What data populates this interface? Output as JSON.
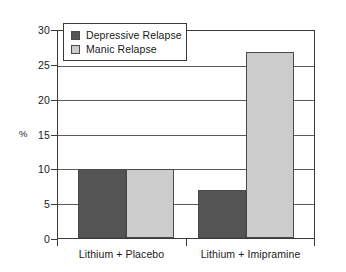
{
  "chart_data": {
    "type": "bar",
    "title": "",
    "xlabel": "",
    "ylabel": "%",
    "ylim": [
      0,
      30
    ],
    "ytick_step": 5,
    "yticks": [
      0,
      5,
      10,
      15,
      20,
      25,
      30
    ],
    "ytick_labels": [
      "0",
      "5",
      "10",
      "15",
      "20",
      "25",
      "30"
    ],
    "categories": [
      "Lithium + Placebo",
      "Lithium + Imipramine"
    ],
    "grid": true,
    "legend_position": "top-left-inside",
    "series": [
      {
        "name": "Depressive Relapse",
        "color": "#545454",
        "values": [
          10,
          7
        ]
      },
      {
        "name": "Manic Relapse",
        "color": "#cccccc",
        "values": [
          10,
          27
        ]
      }
    ]
  },
  "legend": {
    "items": [
      {
        "label": "Depressive Relapse",
        "color": "#545454"
      },
      {
        "label": "Manic Relapse",
        "color": "#cccccc"
      }
    ]
  },
  "axes": {
    "y_title": "%",
    "y_labels": [
      "30",
      "25",
      "20",
      "15",
      "10",
      "5",
      "0"
    ],
    "x_labels": [
      "Lithium + Placebo",
      "Lithium + Imipramine"
    ]
  }
}
